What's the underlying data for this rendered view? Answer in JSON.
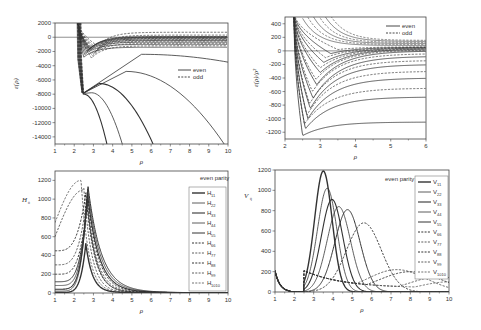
{
  "chart_data": [
    {
      "id": "top-left",
      "type": "line",
      "title": "",
      "xlabel": "ρ",
      "ylabel": "ε(ρ)",
      "xlim": [
        1,
        10
      ],
      "ylim": [
        -15000,
        2000
      ],
      "xticks": [
        1,
        2,
        3,
        4,
        5,
        6,
        7,
        8,
        9,
        10
      ],
      "yticks": [
        2000,
        0,
        -2000,
        -4000,
        -6000,
        -8000,
        -10000,
        -12000,
        -14000
      ],
      "frame": {
        "x0": 55,
        "y0": 23,
        "x1": 228,
        "y1": 144
      },
      "legend": {
        "entries": [
          {
            "label": "even",
            "style": "solid"
          },
          {
            "label": "odd",
            "style": "dashed"
          }
        ],
        "x": 178,
        "y": 70
      },
      "series_note": "Family of potential curves: many even (solid) and odd (dashed) curves diving steeply near rho≈2.2-2.5; lowest branches fall off to -15000 at rho≈3.7, 4.5, 6.1, 9.8; upper curves approach 0 asymptotically",
      "deep_curves": [
        {
          "min_x": 2.5,
          "min_y": -8000,
          "end_x": 3.7,
          "end_y": -15000
        },
        {
          "min_x": 2.9,
          "min_y": -7800,
          "end_x": 4.5,
          "end_y": -15000
        },
        {
          "min_x": 3.3,
          "min_y": -6500,
          "end_x": 6.1,
          "end_y": -15000
        },
        {
          "min_x": 4.7,
          "min_y": -4800,
          "end_x": 9.8,
          "end_y": -15000
        },
        {
          "min_x": 5.5,
          "min_y": -2400,
          "end_x": 10,
          "end_y": -3500
        }
      ],
      "well_curves_even": [
        -1400,
        -1000,
        -700,
        -450,
        -250,
        -100,
        0,
        100
      ],
      "well_curves_odd": [
        -1200,
        -850,
        -550,
        -350,
        -150,
        50,
        300,
        700
      ]
    },
    {
      "id": "top-right",
      "type": "line",
      "title": "",
      "xlabel": "ρ",
      "ylabel": "ε(ρ)/ρ²",
      "xlim": [
        2,
        6
      ],
      "ylim": [
        -1300,
        500
      ],
      "xticks": [
        2,
        3,
        4,
        5,
        6
      ],
      "yticks": [
        400,
        200,
        0,
        -200,
        -400,
        -600,
        -800,
        -1000,
        -1200
      ],
      "frame": {
        "x0": 285,
        "y0": 17,
        "x1": 426,
        "y1": 139
      },
      "legend": {
        "entries": [
          {
            "label": "even",
            "style": "solid"
          },
          {
            "label": "odd",
            "style": "dashed"
          }
        ],
        "x": 400,
        "y": 26
      },
      "series_even": [
        {
          "min_x": 2.5,
          "min_y": -1250,
          "asym": -1050
        },
        {
          "min_x": 2.58,
          "min_y": -1150,
          "asym": -680
        },
        {
          "min_x": 2.65,
          "min_y": -1000,
          "asym": -400
        },
        {
          "min_x": 2.72,
          "min_y": -850,
          "asym": -200
        },
        {
          "min_x": 2.8,
          "min_y": -700,
          "asym": -80
        },
        {
          "min_x": 2.9,
          "min_y": -500,
          "asym": 0
        },
        {
          "min_x": 3.0,
          "min_y": -320,
          "asym": 30
        },
        {
          "min_x": 3.1,
          "min_y": -170,
          "asym": 45
        },
        {
          "min_x": 3.3,
          "min_y": -40,
          "asym": 55
        }
      ],
      "series_odd": [
        {
          "min_x": 2.55,
          "min_y": -1080,
          "asym": -550
        },
        {
          "min_x": 2.62,
          "min_y": -950,
          "asym": -300
        },
        {
          "min_x": 2.7,
          "min_y": -780,
          "asym": -140
        },
        {
          "min_x": 2.78,
          "min_y": -600,
          "asym": -40
        },
        {
          "min_x": 2.88,
          "min_y": -420,
          "asym": 15
        },
        {
          "min_x": 3.0,
          "min_y": -250,
          "asym": 35
        },
        {
          "min_x": 3.15,
          "min_y": -100,
          "asym": 50
        },
        {
          "min_x": 3.5,
          "min_y": 20,
          "asym": 60
        }
      ]
    },
    {
      "id": "bottom-left",
      "type": "line",
      "title": "",
      "xlabel": "ρ",
      "ylabel": "H_ii",
      "xlim": [
        1,
        10
      ],
      "ylim": [
        0,
        1300
      ],
      "xticks": [
        1,
        2,
        3,
        4,
        5,
        6,
        7,
        8,
        9,
        10
      ],
      "yticks": [
        0,
        200,
        400,
        600,
        800,
        1000,
        1200
      ],
      "frame": {
        "x0": 55,
        "y0": 171,
        "x1": 228,
        "y1": 293
      },
      "annotation": "even parity",
      "legend": {
        "entries": [
          {
            "label": "H",
            "sub": "11",
            "style": "solid",
            "width": 1.4
          },
          {
            "label": "H",
            "sub": "22",
            "style": "solid",
            "width": 0.8
          },
          {
            "label": "H",
            "sub": "33",
            "style": "solid",
            "width": 1.1
          },
          {
            "label": "H",
            "sub": "44",
            "style": "solid",
            "width": 0.8
          },
          {
            "label": "H",
            "sub": "55",
            "style": "solid",
            "width": 1.0
          },
          {
            "label": "H",
            "sub": "66",
            "style": "dashed",
            "width": 1.0
          },
          {
            "label": "H",
            "sub": "77",
            "style": "dashed",
            "width": 0.8
          },
          {
            "label": "H",
            "sub": "88",
            "style": "dashed",
            "width": 1.0
          },
          {
            "label": "H",
            "sub": "99",
            "style": "dashed",
            "width": 0.8
          },
          {
            "label": "H",
            "sub": "1010",
            "style": "dashed",
            "width": 0.7
          }
        ]
      },
      "series": [
        {
          "name": "H11",
          "style": "solid",
          "start": 5,
          "peak_x": 2.6,
          "peak_y": 520,
          "tail": 0.35
        },
        {
          "name": "H22",
          "style": "solid",
          "start": 20,
          "peak_x": 2.65,
          "peak_y": 1000,
          "tail": 0.6
        },
        {
          "name": "H33",
          "style": "solid",
          "start": 40,
          "peak_x": 2.68,
          "peak_y": 1050,
          "tail": 0.9
        },
        {
          "name": "H44",
          "style": "solid",
          "start": 80,
          "peak_x": 2.7,
          "peak_y": 1080,
          "tail": 1.0
        },
        {
          "name": "H55",
          "style": "solid",
          "start": 120,
          "peak_x": 2.72,
          "peak_y": 1100,
          "tail": 1.1
        },
        {
          "name": "H66",
          "style": "dashed",
          "start": 200,
          "peak_x": 2.7,
          "peak_y": 1000,
          "tail": 0.8
        },
        {
          "name": "H77",
          "style": "dashed",
          "start": 300,
          "peak_x": 2.65,
          "peak_y": 1000,
          "tail": 0.7
        },
        {
          "name": "H88",
          "style": "dashed",
          "start": 450,
          "peak_x": 2.6,
          "peak_y": 1050,
          "tail": 0.6
        },
        {
          "name": "H99",
          "style": "dashed",
          "start": 600,
          "peak_x": 2.5,
          "peak_y": 1100,
          "tail": 0.5
        },
        {
          "name": "H1010",
          "style": "dashed",
          "start": 750,
          "peak_x": 2.35,
          "peak_y": 1200,
          "tail": 0.45
        }
      ]
    },
    {
      "id": "bottom-right",
      "type": "line",
      "title": "",
      "xlabel": "ρ",
      "ylabel": "V_ij",
      "xlim": [
        1,
        10
      ],
      "ylim": [
        0,
        1200
      ],
      "xticks": [
        1,
        2,
        3,
        4,
        5,
        6,
        7,
        8,
        9,
        10
      ],
      "yticks": [
        0,
        200,
        400,
        600,
        800,
        1000,
        1200
      ],
      "frame": {
        "x0": 275,
        "y0": 170,
        "x1": 449,
        "y1": 292
      },
      "annotation": "even parity",
      "legend": {
        "entries": [
          {
            "label": "V",
            "sub": "11",
            "style": "solid",
            "width": 1.4
          },
          {
            "label": "V",
            "sub": "22",
            "style": "solid",
            "width": 0.8
          },
          {
            "label": "V",
            "sub": "33",
            "style": "solid",
            "width": 1.1
          },
          {
            "label": "V",
            "sub": "44",
            "style": "solid",
            "width": 0.8
          },
          {
            "label": "V",
            "sub": "55",
            "style": "solid",
            "width": 1.0
          },
          {
            "label": "V",
            "sub": "66",
            "style": "dashed",
            "width": 1.0
          },
          {
            "label": "V",
            "sub": "77",
            "style": "dashed",
            "width": 0.8
          },
          {
            "label": "V",
            "sub": "88",
            "style": "dashed",
            "width": 1.0
          },
          {
            "label": "V",
            "sub": "99",
            "style": "dashed",
            "width": 0.8
          },
          {
            "label": "V",
            "sub": "1010",
            "style": "dashed",
            "width": 0.7
          }
        ]
      },
      "series": [
        {
          "name": "V11",
          "style": "solid",
          "peak_x": 3.5,
          "peak_y": 1190,
          "sigma": 0.45
        },
        {
          "name": "V22",
          "style": "solid",
          "peak_x": 3.7,
          "peak_y": 1020,
          "sigma": 0.5
        },
        {
          "name": "V33",
          "style": "solid",
          "peak_x": 3.95,
          "peak_y": 910,
          "sigma": 0.55
        },
        {
          "name": "V44",
          "style": "solid",
          "peak_x": 4.3,
          "peak_y": 840,
          "sigma": 0.6
        },
        {
          "name": "V55",
          "style": "solid",
          "peak_x": 4.75,
          "peak_y": 810,
          "sigma": 0.65
        },
        {
          "name": "V66",
          "style": "dashed",
          "peak_x": 5.6,
          "peak_y": 680,
          "sigma": 0.9
        },
        {
          "name": "V77",
          "style": "dashed",
          "peak_x": 7.3,
          "peak_y": 220,
          "sigma": 1.5
        },
        {
          "name": "V88",
          "style": "dashed",
          "peak_x": 8.0,
          "peak_y": 200,
          "sigma": 1.6
        },
        {
          "name": "V99",
          "style": "dashed",
          "peak_x": 9.5,
          "peak_y": 150,
          "sigma": 1.5
        },
        {
          "name": "V1010",
          "style": "dashed",
          "peak_x": 10,
          "peak_y": 100,
          "sigma": 1.5
        }
      ],
      "common_dip": {
        "x_start": 1.0,
        "y_start": 210,
        "flat_x": [
          1.8,
          2.4
        ],
        "rise_x": 2.7
      }
    }
  ]
}
